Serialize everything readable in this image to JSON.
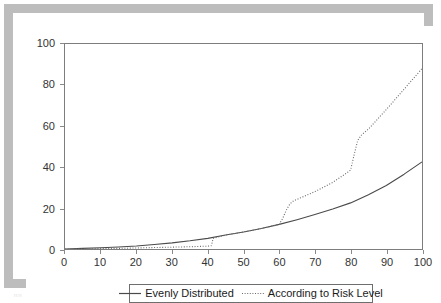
{
  "figure": {
    "background": "#ffffff",
    "frame_color": "#bdbdbd",
    "axis_color": "#7d7d7d",
    "footer_artifact": "nn"
  },
  "legend": {
    "position": "bottom-center",
    "entries": [
      {
        "label": "Evenly Distributed",
        "style": "solid",
        "color": "#4a4a4a",
        "icon": "line-solid-icon"
      },
      {
        "label": "According to Risk Level",
        "style": "dotted",
        "color": "#6a6a6a",
        "icon": "line-dotted-icon"
      }
    ]
  },
  "chart_data": {
    "type": "line",
    "title": "",
    "xlabel": "",
    "ylabel": "",
    "xlim": [
      0,
      100
    ],
    "ylim": [
      0,
      100
    ],
    "grid": false,
    "legend_position": "bottom-center",
    "xticks": [
      0,
      10,
      20,
      30,
      40,
      50,
      60,
      70,
      80,
      90,
      100
    ],
    "yticks": [
      0,
      20,
      40,
      60,
      80,
      100
    ],
    "xtick_labels": [
      "0",
      "10",
      "20",
      "30",
      "40",
      "50",
      "60",
      "70",
      "80",
      "90",
      "100"
    ],
    "ytick_labels": [
      "0",
      "20",
      "40",
      "60",
      "80",
      "100"
    ],
    "series": [
      {
        "name": "Evenly Distributed",
        "style": "solid",
        "color": "#4a4a4a",
        "x": [
          0,
          5,
          10,
          15,
          20,
          25,
          30,
          35,
          40,
          45,
          50,
          55,
          60,
          65,
          70,
          75,
          80,
          85,
          90,
          95,
          100
        ],
        "values": [
          0.0,
          0.3,
          0.6,
          1.0,
          1.5,
          2.2,
          3.0,
          4.0,
          5.2,
          6.8,
          8.3,
          10.0,
          12.0,
          14.3,
          16.8,
          19.5,
          22.5,
          26.5,
          31.0,
          36.5,
          42.5
        ]
      },
      {
        "name": "According to Risk Level",
        "style": "dotted",
        "color": "#6a6a6a",
        "x": [
          0,
          5,
          10,
          15,
          20,
          25,
          30,
          35,
          40,
          41,
          41.5,
          45,
          50,
          55,
          59,
          60,
          61,
          62,
          63,
          64,
          65,
          70,
          75,
          78,
          79,
          80,
          81,
          82,
          83,
          85,
          90,
          95,
          100
        ],
        "values": [
          0.0,
          0.1,
          0.2,
          0.3,
          0.5,
          0.7,
          0.9,
          1.1,
          1.4,
          1.6,
          5.2,
          6.8,
          8.3,
          10.0,
          11.6,
          12.0,
          15.0,
          19.0,
          22.0,
          23.5,
          24.2,
          28.0,
          32.5,
          36.0,
          37.2,
          38.5,
          46.0,
          53.0,
          55.5,
          58.5,
          68.0,
          78.0,
          88.0
        ]
      }
    ]
  }
}
